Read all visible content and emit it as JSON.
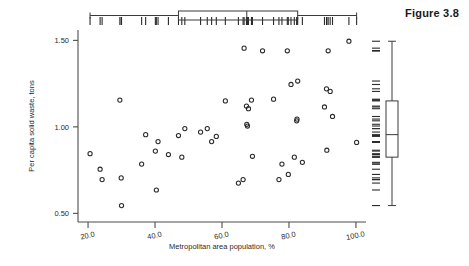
{
  "figure": {
    "label": "Figure 3.8"
  },
  "chart_data": {
    "type": "scatter",
    "title": "",
    "xlabel": "Metropolitan area population, %",
    "ylabel": "Per capita solid waste, tons",
    "xlim": [
      17.0,
      103.0
    ],
    "ylim": [
      0.45,
      1.56
    ],
    "xticks": [
      20.0,
      40.0,
      60.0,
      80.0,
      100.0
    ],
    "xtick_labels": [
      "20.0",
      "40.0",
      "60.0",
      "80.0",
      "100.0"
    ],
    "yticks": [
      0.5,
      1.0,
      1.5
    ],
    "ytick_labels": [
      "0.50",
      "1.00",
      "1.50"
    ],
    "grid": false,
    "legend": null,
    "marker": "open-circle",
    "points": [
      {
        "x": 20.6,
        "y": 0.845
      },
      {
        "x": 23.6,
        "y": 0.755
      },
      {
        "x": 24.2,
        "y": 0.695
      },
      {
        "x": 29.5,
        "y": 1.155
      },
      {
        "x": 29.9,
        "y": 0.705
      },
      {
        "x": 30.0,
        "y": 0.545
      },
      {
        "x": 36.0,
        "y": 0.785
      },
      {
        "x": 37.2,
        "y": 0.955
      },
      {
        "x": 40.1,
        "y": 0.86
      },
      {
        "x": 40.4,
        "y": 0.635
      },
      {
        "x": 40.9,
        "y": 0.915
      },
      {
        "x": 44.0,
        "y": 0.84
      },
      {
        "x": 47.0,
        "y": 0.95
      },
      {
        "x": 48.0,
        "y": 0.825
      },
      {
        "x": 48.9,
        "y": 0.99
      },
      {
        "x": 53.6,
        "y": 0.97
      },
      {
        "x": 55.6,
        "y": 0.99
      },
      {
        "x": 56.9,
        "y": 0.915
      },
      {
        "x": 58.3,
        "y": 0.945
      },
      {
        "x": 61.0,
        "y": 1.15
      },
      {
        "x": 64.9,
        "y": 0.675
      },
      {
        "x": 66.3,
        "y": 0.695
      },
      {
        "x": 66.6,
        "y": 1.455
      },
      {
        "x": 67.3,
        "y": 1.12
      },
      {
        "x": 67.4,
        "y": 1.015
      },
      {
        "x": 67.6,
        "y": 1.005
      },
      {
        "x": 67.9,
        "y": 1.105
      },
      {
        "x": 68.8,
        "y": 1.155
      },
      {
        "x": 69.1,
        "y": 0.83
      },
      {
        "x": 72.1,
        "y": 1.44
      },
      {
        "x": 75.4,
        "y": 1.16
      },
      {
        "x": 77.0,
        "y": 0.695
      },
      {
        "x": 77.9,
        "y": 0.785
      },
      {
        "x": 79.5,
        "y": 1.44
      },
      {
        "x": 79.8,
        "y": 0.725
      },
      {
        "x": 80.6,
        "y": 1.245
      },
      {
        "x": 81.6,
        "y": 0.825
      },
      {
        "x": 82.3,
        "y": 1.035
      },
      {
        "x": 82.4,
        "y": 1.045
      },
      {
        "x": 82.6,
        "y": 1.265
      },
      {
        "x": 84.0,
        "y": 0.795
      },
      {
        "x": 90.6,
        "y": 1.115
      },
      {
        "x": 91.2,
        "y": 1.22
      },
      {
        "x": 91.3,
        "y": 0.865
      },
      {
        "x": 91.7,
        "y": 1.44
      },
      {
        "x": 92.3,
        "y": 1.205
      },
      {
        "x": 93.0,
        "y": 1.06
      },
      {
        "x": 97.9,
        "y": 1.495
      },
      {
        "x": 100.2,
        "y": 0.91
      }
    ],
    "marginal_x": {
      "type": "boxplot-with-rug",
      "position": "top",
      "whisker_min": 20.6,
      "q1": 47.0,
      "median": 67.4,
      "q3": 82.6,
      "whisker_max": 100.2,
      "rug_values": [
        20.6,
        23.6,
        24.2,
        29.5,
        29.9,
        30.0,
        36.0,
        37.2,
        40.1,
        40.4,
        40.9,
        44.0,
        47.0,
        48.0,
        48.9,
        53.6,
        55.6,
        56.9,
        58.3,
        61.0,
        64.9,
        66.3,
        66.6,
        67.3,
        67.4,
        67.6,
        67.9,
        68.8,
        69.1,
        72.1,
        75.4,
        77.0,
        77.9,
        79.5,
        79.8,
        80.6,
        81.6,
        82.3,
        82.4,
        82.6,
        84.0,
        90.6,
        91.2,
        91.3,
        91.7,
        92.3,
        93.0,
        97.9,
        100.2
      ]
    },
    "marginal_y": {
      "type": "boxplot-with-rug",
      "position": "right",
      "whisker_min": 0.545,
      "q1": 0.825,
      "median": 0.955,
      "q3": 1.15,
      "whisker_max": 1.495,
      "rug_values": [
        0.545,
        0.635,
        0.675,
        0.695,
        0.695,
        0.705,
        0.725,
        0.755,
        0.785,
        0.785,
        0.795,
        0.825,
        0.825,
        0.83,
        0.84,
        0.845,
        0.86,
        0.865,
        0.91,
        0.915,
        0.915,
        0.945,
        0.95,
        0.955,
        0.97,
        0.99,
        0.99,
        1.005,
        1.015,
        1.035,
        1.045,
        1.06,
        1.105,
        1.115,
        1.12,
        1.15,
        1.155,
        1.155,
        1.16,
        1.205,
        1.22,
        1.245,
        1.265,
        1.44,
        1.44,
        1.44,
        1.455,
        1.495
      ]
    },
    "colors": {
      "marker_stroke": "#2b2b2b",
      "axis": "#4d4d4d",
      "box": "#3a3a3a",
      "text": "#2b2b2b"
    }
  }
}
